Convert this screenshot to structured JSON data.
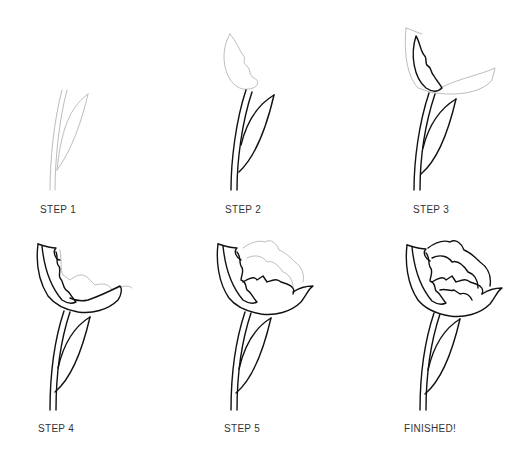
{
  "steps": [
    {
      "label": "STEP 1"
    },
    {
      "label": "STEP 2"
    },
    {
      "label": "STEP 3"
    },
    {
      "label": "STEP 4"
    },
    {
      "label": "STEP 5"
    },
    {
      "label": "FINISHED!"
    }
  ],
  "colors": {
    "background": "#ffffff",
    "guide_line": "#bdbdbd",
    "ink_line": "#111111",
    "label_text": "#333333"
  }
}
